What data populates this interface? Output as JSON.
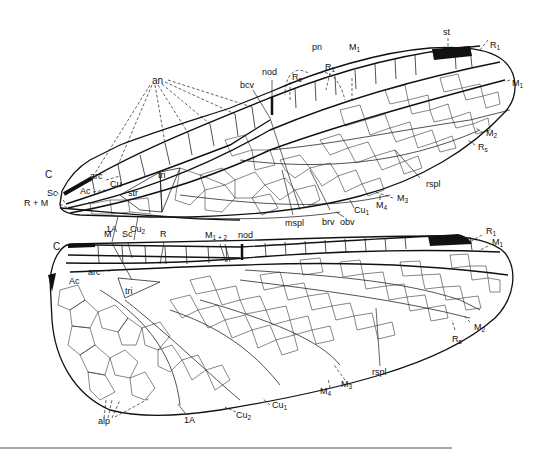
{
  "figure": {
    "colors": {
      "vein": "#111111",
      "pterostigma": "#111111",
      "background": "#ffffff",
      "rule": "#555555"
    }
  },
  "forewing": {
    "labels": {
      "C": "C",
      "Sc": "Sc",
      "RM": "R + M",
      "arc": "arc",
      "Ac": "Ac",
      "Cu": "Cu",
      "str": "str",
      "tri": "tri",
      "an": "an",
      "bcv": "bcv",
      "nod": "nod",
      "Rs_base": "R",
      "Rs_base_sub": "s",
      "pn": "pn",
      "R1_inner": "R",
      "R1_inner_sub": "1",
      "M1_inner": "M",
      "M1_inner_sub": "1",
      "st": "st",
      "R1_tip": "R",
      "R1_tip_sub": "1",
      "M1_tip": "M",
      "M1_tip_sub": "1",
      "M2": "M",
      "M2_sub": "2",
      "Rs": "R",
      "Rs_sub": "s",
      "rspl": "rspl",
      "M3": "M",
      "M3_sub": "3",
      "M4": "M",
      "M4_sub": "4",
      "Cu1": "Cu",
      "Cu1_sub": "1",
      "obv": "obv",
      "brv": "brv",
      "mspl": "mspl",
      "A1": "1A",
      "Cu2": "Cu",
      "Cu2_sub": "2"
    }
  },
  "hindwing": {
    "labels": {
      "C": "C",
      "M": "M",
      "Sc": "Sc",
      "R": "R",
      "M12": "M",
      "M12_sub": "1 + 2",
      "nod": "nod",
      "arc": "arc",
      "Ac": "Ac",
      "tri": "tri",
      "R1": "R",
      "R1_sub": "1",
      "M1": "M",
      "M1_sub": "1",
      "M2": "M",
      "M2_sub": "2",
      "Rs": "R",
      "Rs_sub": "s",
      "rspl": "rspl",
      "M3": "M",
      "M3_sub": "3",
      "M4": "M",
      "M4_sub": "4",
      "Cu1": "Cu",
      "Cu1_sub": "1",
      "Cu2": "Cu",
      "Cu2_sub": "2",
      "A1": "1A",
      "alp": "alp"
    }
  }
}
